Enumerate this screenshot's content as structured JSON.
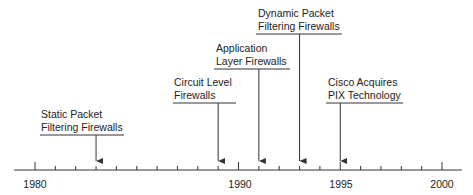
{
  "colors": {
    "line": "#333333",
    "text": "#222222",
    "background": "#ffffff"
  },
  "axis": {
    "start_year": 1980,
    "end_year": 2000,
    "minor_tick_every": 1,
    "major_labels": [
      "1980",
      "1990",
      "1995",
      "2000"
    ],
    "major_label_years": [
      1980,
      1990,
      1995,
      2000
    ]
  },
  "events": [
    {
      "year": 1983,
      "line1": "Static Packet",
      "line2": "Filtering Firewalls"
    },
    {
      "year": 1989,
      "line1": "Circuit Level",
      "line2": "Firewalls"
    },
    {
      "year": 1991,
      "line1": "Application",
      "line2": "Layer Firewalls"
    },
    {
      "year": 1993,
      "line1": "Dynamic Packet",
      "line2": "Filtering Firewalls"
    },
    {
      "year": 1995,
      "line1": "Cisco Acquires",
      "line2": "PIX Technology"
    }
  ]
}
